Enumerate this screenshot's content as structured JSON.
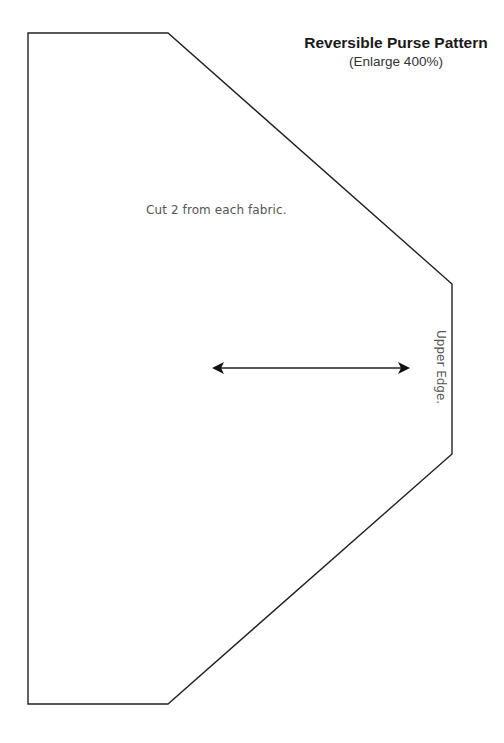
{
  "header": {
    "title": "Reversible Purse Pattern",
    "subtitle": "(Enlarge 400%)"
  },
  "pattern": {
    "cut_instruction": "Cut 2 from each fabric.",
    "edge_label": "Upper Edge.",
    "grainline_arrow": "double-headed-arrow",
    "outline_color": "#222222",
    "shape_points": [
      [
        28,
        33
      ],
      [
        168,
        33
      ],
      [
        452,
        284
      ],
      [
        452,
        454
      ],
      [
        168,
        704
      ],
      [
        28,
        704
      ]
    ]
  }
}
